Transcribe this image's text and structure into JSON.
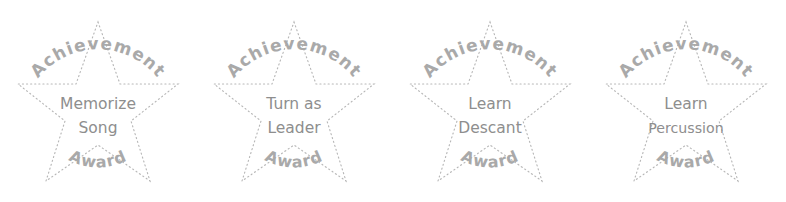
{
  "page": {
    "background_color": "#ffffff",
    "width": 786,
    "height": 202
  },
  "style_colors": {
    "star_outline": "#b7b7b7",
    "arc_text": "#a9a9a9",
    "center_text": "#8e8e8e"
  },
  "badges": [
    {
      "arc_top_text": "Achievement",
      "arc_bottom_text": "Award",
      "center_line1": "Memorize",
      "center_line2": "Song",
      "shape": "five-point-star",
      "outline_style": "dotted"
    },
    {
      "arc_top_text": "Achievement",
      "arc_bottom_text": "Award",
      "center_line1": "Turn as",
      "center_line2": "Leader",
      "shape": "five-point-star",
      "outline_style": "dotted"
    },
    {
      "arc_top_text": "Achievement",
      "arc_bottom_text": "Award",
      "center_line1": "Learn",
      "center_line2": "Descant",
      "shape": "five-point-star",
      "outline_style": "dotted"
    },
    {
      "arc_top_text": "Achievement",
      "arc_bottom_text": "Award",
      "center_line1": "Learn",
      "center_line2": "Percussion",
      "shape": "five-point-star",
      "outline_style": "dotted"
    }
  ]
}
